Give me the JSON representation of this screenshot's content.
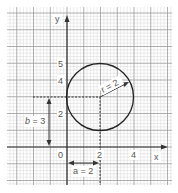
{
  "diagram": {
    "axes": {
      "x_label": "x",
      "y_label": "y",
      "origin_label": "0",
      "x_ticks": [
        {
          "value": 2,
          "label": "2"
        },
        {
          "value": 4,
          "label": "4"
        }
      ],
      "y_ticks": [
        {
          "value": 2,
          "label": "2"
        },
        {
          "value": 4,
          "label": "4"
        },
        {
          "value": 5,
          "label": "5"
        }
      ]
    },
    "circle": {
      "center": [
        2,
        3
      ],
      "radius": 2
    },
    "annotations": {
      "radius_label": "r = 2",
      "a_label": "a = 2",
      "b_label": "b = 3"
    },
    "colors": {
      "major_grid": "#9a9a9a",
      "minor_grid": "#d8d8d8",
      "axis": "#333333",
      "circle": "#222222",
      "text": "#555555"
    }
  }
}
